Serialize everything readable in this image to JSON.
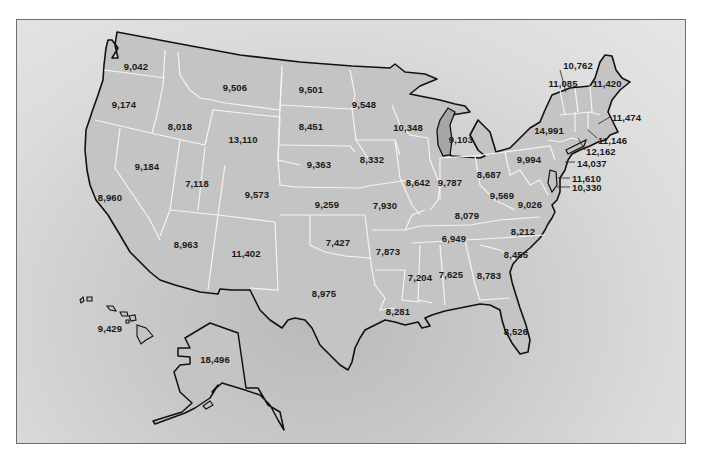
{
  "chart_data": {
    "type": "choropleth-map",
    "title": "",
    "values": {
      "Washington": 9042,
      "Oregon": 9174,
      "California": 8960,
      "Idaho": 8018,
      "Nevada": 9184,
      "Montana": 9506,
      "Wyoming": 13110,
      "Utah": 7118,
      "Arizona": 8963,
      "Colorado": 9573,
      "New Mexico": 11402,
      "North Dakota": 9501,
      "South Dakota": 8451,
      "Nebraska": 9363,
      "Kansas": 9259,
      "Oklahoma": 7427,
      "Texas": 8975,
      "Minnesota": 9548,
      "Iowa": 8332,
      "Missouri": 7930,
      "Arkansas": 7873,
      "Louisiana": 8281,
      "Wisconsin": 10348,
      "Illinois": 8642,
      "Michigan": 9103,
      "Indiana": 9787,
      "Ohio": 8687,
      "Kentucky": 8079,
      "Tennessee": 6949,
      "Mississippi": 7204,
      "Alabama": 7625,
      "Georgia": 8783,
      "Florida": 8526,
      "South Carolina": 8455,
      "North Carolina": 8212,
      "Virginia": 9026,
      "West Virginia": 9569,
      "Pennsylvania": 9994,
      "New York": 14991,
      "Vermont": 11085,
      "New Hampshire": 10762,
      "Maine": 11420,
      "Massachusetts": 11474,
      "Rhode Island": 11146,
      "Connecticut": 12162,
      "New Jersey": 14037,
      "Delaware": 11610,
      "Maryland": 10330,
      "Alaska": 18496,
      "Hawaii": 9429
    }
  },
  "labels": [
    {
      "state": "Washington",
      "text": "9,042",
      "x": 136,
      "y": 66
    },
    {
      "state": "Oregon",
      "text": "9,174",
      "x": 124,
      "y": 104
    },
    {
      "state": "California",
      "text": "8,960",
      "x": 110,
      "y": 197
    },
    {
      "state": "Idaho",
      "text": "8,018",
      "x": 180,
      "y": 126
    },
    {
      "state": "Nevada",
      "text": "9,184",
      "x": 147,
      "y": 166
    },
    {
      "state": "Montana",
      "text": "9,506",
      "x": 235,
      "y": 87
    },
    {
      "state": "Wyoming",
      "text": "13,110",
      "x": 243,
      "y": 139
    },
    {
      "state": "Utah",
      "text": "7,118",
      "x": 197,
      "y": 183
    },
    {
      "state": "Arizona",
      "text": "8,963",
      "x": 186,
      "y": 244
    },
    {
      "state": "Colorado",
      "text": "9,573",
      "x": 257,
      "y": 194
    },
    {
      "state": "New Mexico",
      "text": "11,402",
      "x": 246,
      "y": 253
    },
    {
      "state": "North Dakota",
      "text": "9,501",
      "x": 311,
      "y": 89
    },
    {
      "state": "South Dakota",
      "text": "8,451",
      "x": 311,
      "y": 126
    },
    {
      "state": "Nebraska",
      "text": "9,363",
      "x": 319,
      "y": 164
    },
    {
      "state": "Kansas",
      "text": "9,259",
      "x": 327,
      "y": 204
    },
    {
      "state": "Oklahoma",
      "text": "7,427",
      "x": 338,
      "y": 242
    },
    {
      "state": "Texas",
      "text": "8,975",
      "x": 324,
      "y": 293
    },
    {
      "state": "Minnesota",
      "text": "9,548",
      "x": 364,
      "y": 104
    },
    {
      "state": "Iowa",
      "text": "8,332",
      "x": 372,
      "y": 159
    },
    {
      "state": "Missouri",
      "text": "7,930",
      "x": 385,
      "y": 205
    },
    {
      "state": "Arkansas",
      "text": "7,873",
      "x": 388,
      "y": 251
    },
    {
      "state": "Louisiana",
      "text": "8,281",
      "x": 398,
      "y": 311
    },
    {
      "state": "Wisconsin",
      "text": "10,348",
      "x": 408,
      "y": 127
    },
    {
      "state": "Illinois",
      "text": "8,642",
      "x": 418,
      "y": 182
    },
    {
      "state": "Michigan",
      "text": "9,103",
      "x": 461,
      "y": 139
    },
    {
      "state": "Indiana",
      "text": "9,787",
      "x": 450,
      "y": 182
    },
    {
      "state": "Ohio",
      "text": "8,687",
      "x": 489,
      "y": 174
    },
    {
      "state": "Kentucky",
      "text": "8,079",
      "x": 467,
      "y": 215
    },
    {
      "state": "Tennessee",
      "text": "6,949",
      "x": 454,
      "y": 238
    },
    {
      "state": "Mississippi",
      "text": "7,204",
      "x": 420,
      "y": 277
    },
    {
      "state": "Alabama",
      "text": "7,625",
      "x": 451,
      "y": 274
    },
    {
      "state": "Georgia",
      "text": "8,783",
      "x": 489,
      "y": 275
    },
    {
      "state": "Florida",
      "text": "8,526",
      "x": 516,
      "y": 331
    },
    {
      "state": "South Carolina",
      "text": "8,455",
      "x": 516,
      "y": 254
    },
    {
      "state": "North Carolina",
      "text": "8,212",
      "x": 523,
      "y": 231
    },
    {
      "state": "Virginia",
      "text": "9,026",
      "x": 530,
      "y": 204
    },
    {
      "state": "West Virginia",
      "text": "9,569",
      "x": 502,
      "y": 195
    },
    {
      "state": "Pennsylvania",
      "text": "9,994",
      "x": 529,
      "y": 159
    },
    {
      "state": "New York",
      "text": "14,991",
      "x": 549,
      "y": 130
    },
    {
      "state": "Vermont",
      "text": "11,085",
      "x": 563,
      "y": 83
    },
    {
      "state": "New Hampshire",
      "text": "10,762",
      "x": 578,
      "y": 65
    },
    {
      "state": "Maine",
      "text": "11,420",
      "x": 607,
      "y": 83
    },
    {
      "state": "Massachusetts",
      "text": "11,474",
      "x": 612,
      "y": 117,
      "align": "left"
    },
    {
      "state": "Rhode Island",
      "text": "11,146",
      "x": 598,
      "y": 140,
      "align": "left"
    },
    {
      "state": "Connecticut",
      "text": "12,162",
      "x": 586,
      "y": 151,
      "align": "left"
    },
    {
      "state": "New Jersey",
      "text": "14,037",
      "x": 577,
      "y": 163,
      "align": "left"
    },
    {
      "state": "Delaware",
      "text": "11,610",
      "x": 572,
      "y": 178,
      "align": "left"
    },
    {
      "state": "Maryland",
      "text": "10,330",
      "x": 572,
      "y": 187,
      "align": "left"
    },
    {
      "state": "Alaska",
      "text": "18,496",
      "x": 215,
      "y": 359
    },
    {
      "state": "Hawaii",
      "text": "9,429",
      "x": 110,
      "y": 328
    }
  ]
}
